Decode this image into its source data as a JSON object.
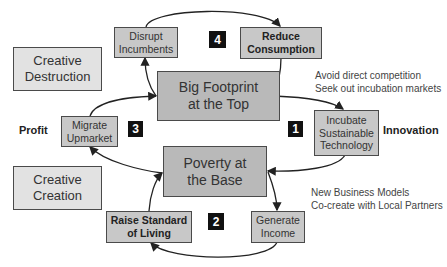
{
  "diagram": {
    "center_boxes": {
      "top": {
        "line1": "Big Footprint",
        "line2": "at the Top"
      },
      "base": {
        "line1": "Poverty at",
        "line2": "the Base"
      }
    },
    "side_boxes": {
      "creative_destruction": {
        "line1": "Creative",
        "line2": "Destruction"
      },
      "creative_creation": {
        "line1": "Creative",
        "line2": "Creation"
      }
    },
    "steps": {
      "disrupt": {
        "line1": "Disrupt",
        "line2": "Incumbents"
      },
      "reduce": {
        "line1": "Reduce",
        "line2": "Consumption"
      },
      "migrate": {
        "line1": "Migrate",
        "line2": "Upmarket"
      },
      "incubate": {
        "line1": "Incubate",
        "line2": "Sustainable",
        "line3": "Technology"
      },
      "raise": {
        "line1": "Raise Standard",
        "line2": "of Living"
      },
      "generate": {
        "line1": "Generate",
        "line2": "Income"
      }
    },
    "badges": {
      "b1": "1",
      "b2": "2",
      "b3": "3",
      "b4": "4"
    },
    "labels": {
      "profit": "Profit",
      "innovation": "Innovation"
    },
    "notes": {
      "top_right": {
        "line1": "Avoid direct competition",
        "line2": "Seek out incubation markets"
      },
      "bottom_right": {
        "line1": "New Business Models",
        "line2": "Co-create with Local Partners"
      }
    },
    "colors": {
      "box_light": "#e2e2e2",
      "box_mid": "#c8c8c8",
      "box_dark": "#b9b9b9",
      "border": "#4a4a4a",
      "badge": "#111111"
    }
  }
}
